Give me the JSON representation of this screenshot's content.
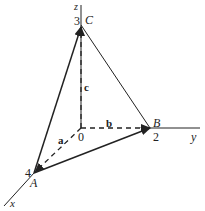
{
  "diagram": {
    "axes": {
      "x": "x",
      "y": "y",
      "z": "z"
    },
    "origin": "0",
    "points": {
      "A": {
        "label": "A",
        "coord": "4"
      },
      "B": {
        "label": "B",
        "coord": "2"
      },
      "C": {
        "label": "C",
        "coord": "3"
      }
    },
    "vectors": {
      "a": "a",
      "b": "b",
      "c": "c"
    },
    "colors": {
      "line": "#222222",
      "background": "#ffffff"
    }
  }
}
